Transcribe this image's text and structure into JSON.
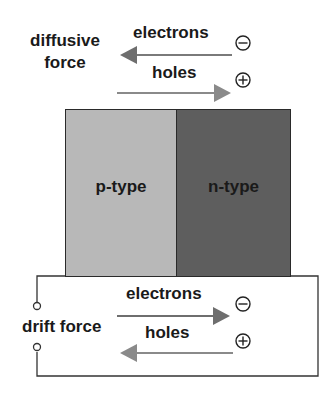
{
  "diffusion": {
    "force_label_line1": "diffusive",
    "force_label_line2": "force",
    "electrons_label": "electrons",
    "holes_label": "holes",
    "electrons_direction": "left",
    "holes_direction": "right"
  },
  "junction": {
    "p_label": "p-type",
    "n_label": "n-type",
    "p_color": "#b8b8b8",
    "n_color": "#5e5e5e"
  },
  "drift": {
    "force_label": "drift force",
    "electrons_label": "electrons",
    "holes_label": "holes",
    "electrons_direction": "right",
    "holes_direction": "left"
  },
  "symbols": {
    "electron": "minus-circle",
    "hole": "plus-circle"
  },
  "colors": {
    "arrow": "#7a7a7a",
    "text": "#1a1a1a",
    "outline": "#2a2a2a"
  }
}
